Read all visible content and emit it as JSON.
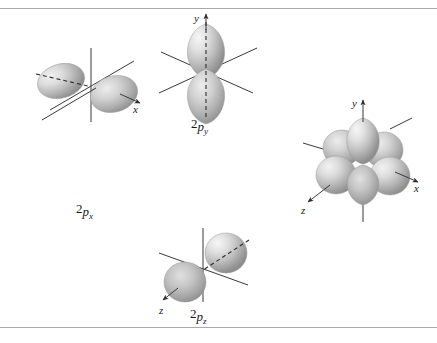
{
  "figure": {
    "background_color": "#ffffff",
    "rule_color": "#a9a9a9",
    "lobe_color_light": "#e8e8e8",
    "lobe_color_mid": "#b8b8b8",
    "lobe_color_dark": "#808080",
    "axis_color": "#3a3a3a"
  },
  "diagrams": [
    {
      "id": "2px",
      "name": "2p-x-orbital",
      "label_prefix": "2",
      "label_p": "p",
      "label_sub": "x",
      "label_full": "2px",
      "axis_labels": [
        "x"
      ],
      "lobe_count": 2,
      "orientation": "along-x"
    },
    {
      "id": "2py",
      "name": "2p-y-orbital",
      "label_prefix": "2",
      "label_p": "p",
      "label_sub": "y",
      "label_full": "2py",
      "axis_labels": [
        "y"
      ],
      "lobe_count": 2,
      "orientation": "along-y"
    },
    {
      "id": "2pz",
      "name": "2p-z-orbital",
      "label_prefix": "2",
      "label_p": "p",
      "label_sub": "z",
      "label_full": "2pz",
      "axis_labels": [
        "z"
      ],
      "lobe_count": 2,
      "orientation": "along-z"
    },
    {
      "id": "combined",
      "name": "combined-2p-orbitals",
      "label_prefix": "",
      "label_p": "",
      "label_sub": "",
      "label_full": "",
      "axis_labels": [
        "y",
        "x",
        "z"
      ],
      "lobe_count": 6,
      "orientation": "all-three"
    }
  ],
  "axis_text": {
    "x": "x",
    "y": "y",
    "z": "z"
  },
  "labels": {
    "two": "2",
    "p": "p",
    "x": "x",
    "y": "y",
    "z": "z"
  }
}
